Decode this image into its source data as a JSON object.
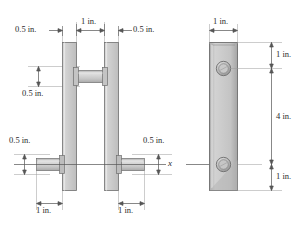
{
  "figure": {
    "title": "",
    "type": "engineering-drawing",
    "views": [
      {
        "name": "front-view",
        "description": "two parallel vertical plates with pins"
      },
      {
        "name": "side-view",
        "description": "single vertical plate with hole"
      }
    ],
    "axis_label": "x",
    "colors": {
      "plate_fill": "#c9c9c9",
      "plate_fill_light": "#dadada",
      "plate_edge": "#6e6e6e",
      "pin_fill": "#c2c2c2",
      "dimension_line": "#555555",
      "text": "#2a2a2a",
      "background": "#ffffff"
    }
  },
  "dimensions": {
    "front": {
      "top_left": "0.5 in.",
      "top_center": "1 in.",
      "top_right": "0.5 in.",
      "left_upper": "0.5 in.",
      "left_lower": "0.5 in.",
      "right_lower": "0.5 in.",
      "bottom_left": "1 in.",
      "bottom_right": "1 in."
    },
    "side": {
      "top_width": "1 in.",
      "right_upper": "1 in.",
      "right_middle": "4 in.",
      "right_lower": "1 in."
    }
  }
}
